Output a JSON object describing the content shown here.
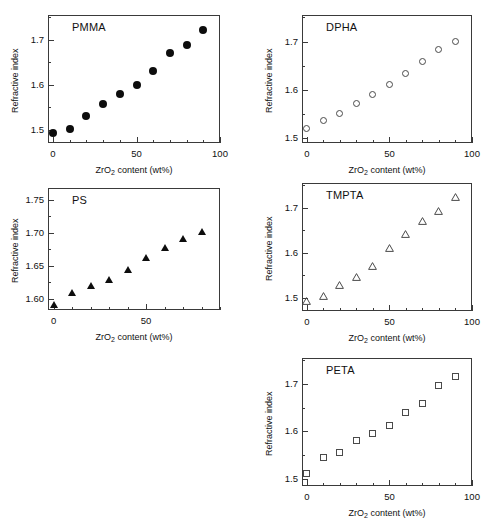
{
  "figure": {
    "axis_label_x": "ZrO2 content (wt%)",
    "axis_label_x_prefix": "ZrO",
    "axis_label_x_sub": "2",
    "axis_label_x_suffix": " content (wt%)",
    "axis_label_y": "Refractive index",
    "marker_color": "#0d0d0d",
    "frame_color": "#3a3a3a",
    "background": "#ffffff"
  },
  "chart_data": [
    {
      "type": "scatter",
      "title": "PMMA",
      "xlabel": "ZrO2 content (wt%)",
      "ylabel": "Refractive index",
      "marker": "filled-circle",
      "xlim": [
        -3,
        100
      ],
      "ylim": [
        1.47,
        1.755
      ],
      "xticks": [
        0,
        10,
        20,
        30,
        40,
        50,
        60,
        70,
        80,
        90,
        100
      ],
      "xtick_labels": [
        {
          "value": 0,
          "label": "0"
        },
        {
          "value": 50,
          "label": "50"
        },
        {
          "value": 100,
          "label": "100"
        }
      ],
      "yticks": [
        1.5,
        1.55,
        1.6,
        1.65,
        1.7,
        1.75
      ],
      "ytick_labels": [
        {
          "value": 1.5,
          "label": "1.5"
        },
        {
          "value": 1.6,
          "label": "1.6"
        },
        {
          "value": 1.7,
          "label": "1.7"
        }
      ],
      "grid": false,
      "legend": "none",
      "x": [
        0,
        10,
        20,
        30,
        40,
        50,
        60,
        70,
        80,
        90
      ],
      "y": [
        1.493,
        1.502,
        1.53,
        1.557,
        1.58,
        1.6,
        1.631,
        1.67,
        1.689,
        1.722
      ]
    },
    {
      "type": "scatter",
      "title": "DPHA",
      "xlabel": "ZrO2 content (wt%)",
      "ylabel": "Refractive index",
      "marker": "open-circle",
      "xlim": [
        -3,
        100
      ],
      "ylim": [
        1.49,
        1.755
      ],
      "xticks": [
        0,
        10,
        20,
        30,
        40,
        50,
        60,
        70,
        80,
        90,
        100
      ],
      "xtick_labels": [
        {
          "value": 0,
          "label": "0"
        },
        {
          "value": 50,
          "label": "50"
        },
        {
          "value": 100,
          "label": "100"
        }
      ],
      "yticks": [
        1.5,
        1.55,
        1.6,
        1.65,
        1.7,
        1.75
      ],
      "ytick_labels": [
        {
          "value": 1.5,
          "label": "1.5"
        },
        {
          "value": 1.6,
          "label": "1.6"
        },
        {
          "value": 1.7,
          "label": "1.7"
        }
      ],
      "grid": false,
      "legend": "none",
      "x": [
        0,
        10,
        20,
        30,
        40,
        50,
        60,
        70,
        80,
        90
      ],
      "y": [
        1.521,
        1.537,
        1.552,
        1.571,
        1.591,
        1.612,
        1.633,
        1.658,
        1.684,
        1.701
      ]
    },
    {
      "type": "scatter",
      "title": "PS",
      "xlabel": "ZrO2 content (wt%)",
      "ylabel": "Refractive index",
      "marker": "filled-triangle",
      "xlim": [
        -3,
        90
      ],
      "ylim": [
        1.583,
        1.768
      ],
      "xticks": [
        0,
        10,
        20,
        30,
        40,
        50,
        60,
        70,
        80,
        90
      ],
      "xtick_labels": [
        {
          "value": 0,
          "label": "0"
        },
        {
          "value": 50,
          "label": "50"
        }
      ],
      "yticks": [
        1.6,
        1.625,
        1.65,
        1.675,
        1.7,
        1.725,
        1.75
      ],
      "ytick_labels": [
        {
          "value": 1.6,
          "label": "1.60"
        },
        {
          "value": 1.65,
          "label": "1.65"
        },
        {
          "value": 1.7,
          "label": "1.70"
        },
        {
          "value": 1.75,
          "label": "1.75"
        }
      ],
      "grid": false,
      "legend": "none",
      "x": [
        0,
        10,
        20,
        30,
        40,
        50,
        60,
        70,
        80
      ],
      "y": [
        1.592,
        1.61,
        1.62,
        1.629,
        1.645,
        1.662,
        1.678,
        1.691,
        1.702
      ]
    },
    {
      "type": "scatter",
      "title": "TMPTA",
      "xlabel": "ZrO2 content (wt%)",
      "ylabel": "Refractive index",
      "marker": "open-triangle",
      "xlim": [
        -3,
        100
      ],
      "ylim": [
        1.47,
        1.755
      ],
      "xticks": [
        0,
        10,
        20,
        30,
        40,
        50,
        60,
        70,
        80,
        90,
        100
      ],
      "xtick_labels": [
        {
          "value": 0,
          "label": "0"
        },
        {
          "value": 50,
          "label": "50"
        },
        {
          "value": 100,
          "label": "100"
        }
      ],
      "yticks": [
        1.5,
        1.55,
        1.6,
        1.65,
        1.7,
        1.75
      ],
      "ytick_labels": [
        {
          "value": 1.5,
          "label": "1.5"
        },
        {
          "value": 1.6,
          "label": "1.6"
        },
        {
          "value": 1.7,
          "label": "1.7"
        }
      ],
      "grid": false,
      "legend": "none",
      "x": [
        0,
        10,
        20,
        30,
        40,
        50,
        60,
        70,
        80,
        90
      ],
      "y": [
        1.492,
        1.503,
        1.528,
        1.545,
        1.571,
        1.611,
        1.641,
        1.67,
        1.692,
        1.723
      ]
    },
    {
      "type": "scatter",
      "title": "PETA",
      "xlabel": "ZrO2 content (wt%)",
      "ylabel": "Refractive index",
      "marker": "open-square",
      "xlim": [
        -3,
        100
      ],
      "ylim": [
        1.485,
        1.755
      ],
      "xticks": [
        0,
        10,
        20,
        30,
        40,
        50,
        60,
        70,
        80,
        90,
        100
      ],
      "xtick_labels": [
        {
          "value": 0,
          "label": "0"
        },
        {
          "value": 50,
          "label": "50"
        },
        {
          "value": 100,
          "label": "100"
        }
      ],
      "yticks": [
        1.5,
        1.55,
        1.6,
        1.65,
        1.7,
        1.75
      ],
      "ytick_labels": [
        {
          "value": 1.5,
          "label": "1.5"
        },
        {
          "value": 1.6,
          "label": "1.6"
        },
        {
          "value": 1.7,
          "label": "1.7"
        }
      ],
      "grid": false,
      "legend": "none",
      "x": [
        0,
        10,
        20,
        30,
        40,
        50,
        60,
        70,
        80,
        90
      ],
      "y": [
        1.512,
        1.546,
        1.556,
        1.58,
        1.595,
        1.613,
        1.641,
        1.658,
        1.697,
        1.715
      ]
    }
  ],
  "panel_layout": [
    {
      "key": "PMMA",
      "frame": {
        "left": 48,
        "top": 15,
        "width": 172,
        "height": 128
      }
    },
    {
      "key": "DPHA",
      "frame": {
        "left": 302,
        "top": 15,
        "width": 170,
        "height": 128
      }
    },
    {
      "key": "PS",
      "frame": {
        "left": 48,
        "top": 188,
        "width": 172,
        "height": 122
      }
    },
    {
      "key": "TMPTA",
      "frame": {
        "left": 302,
        "top": 183,
        "width": 170,
        "height": 128
      }
    },
    {
      "key": "PETA",
      "frame": {
        "left": 302,
        "top": 358,
        "width": 170,
        "height": 128
      }
    }
  ]
}
